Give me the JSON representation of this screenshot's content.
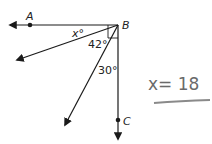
{
  "diagram": {
    "points": [
      {
        "name": "A",
        "label": "A"
      },
      {
        "name": "B",
        "label": "B"
      },
      {
        "name": "C",
        "label": "C"
      }
    ],
    "angles": [
      {
        "label": "x°"
      },
      {
        "label": "42°"
      },
      {
        "label": "30°"
      }
    ],
    "right_angle_at": "B",
    "line_color": "#1a1a1a"
  },
  "answer": {
    "text": "x= 18",
    "color": "#6a6a6a"
  }
}
